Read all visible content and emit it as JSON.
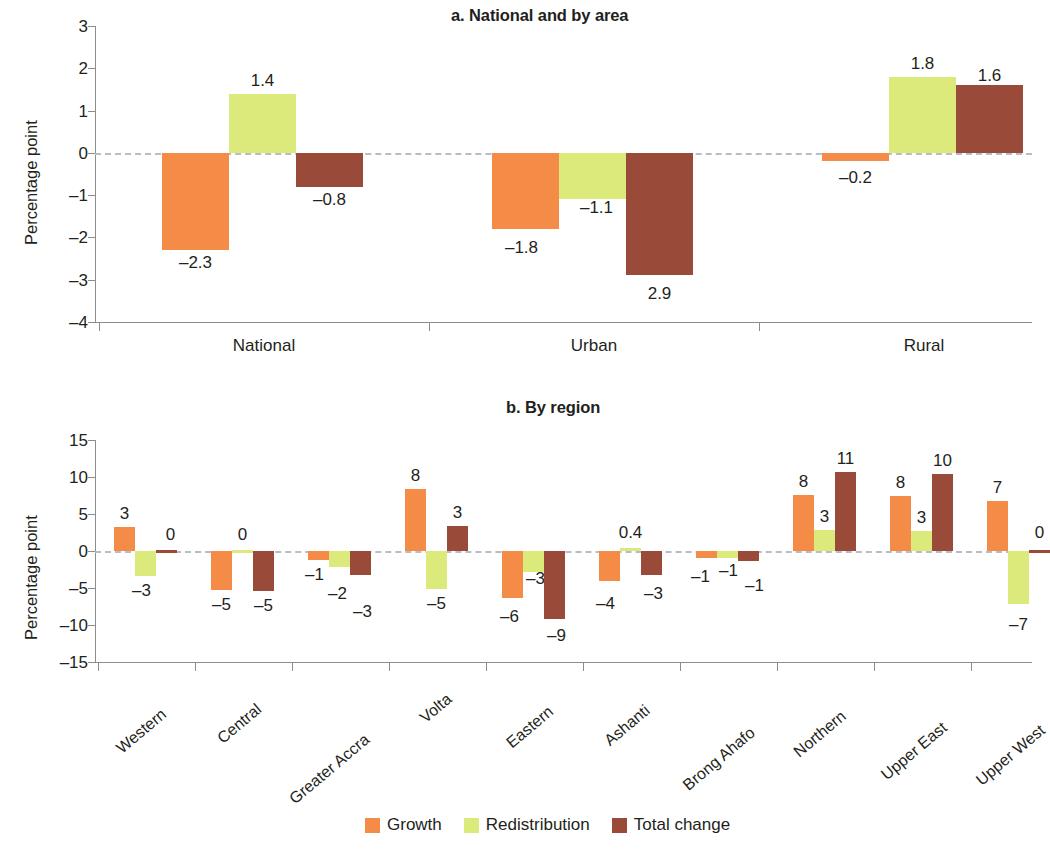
{
  "figure": {
    "legend": {
      "items": [
        {
          "label": "Growth",
          "color": "#F48B47"
        },
        {
          "label": "Redistribution",
          "color": "#DCEA7C"
        },
        {
          "label": "Total change",
          "color": "#9A4A38"
        }
      ]
    }
  },
  "chart_data": [
    {
      "type": "bar",
      "title": "a. National and by area",
      "xlabel": "",
      "ylabel": "Percentage point",
      "categories": [
        "National",
        "Urban",
        "Rural"
      ],
      "yticks": [
        3,
        2,
        1,
        0,
        -1,
        -2,
        -3,
        -4
      ],
      "ytick_labels": [
        "3",
        "2",
        "1",
        "0",
        "-1",
        "-2",
        "-3",
        "-4"
      ],
      "ylim": [
        -4,
        3
      ],
      "grid": false,
      "legend_position": "bottom",
      "series": [
        {
          "name": "Growth",
          "color": "#F48B47",
          "values": [
            -2.3,
            -1.8,
            -0.2
          ],
          "labels": [
            "-2.3",
            "-1.8",
            "-0.2"
          ]
        },
        {
          "name": "Redistribution",
          "color": "#DCEA7C",
          "values": [
            1.4,
            -1.1,
            1.8
          ],
          "labels": [
            "1.4",
            "-1.1",
            "1.8"
          ]
        },
        {
          "name": "Total change",
          "color": "#9A4A38",
          "values": [
            -0.8,
            -2.9,
            1.6
          ],
          "labels": [
            "-0.8",
            "2.9",
            "1.6"
          ]
        }
      ]
    },
    {
      "type": "bar",
      "title": "b. By region",
      "xlabel": "",
      "ylabel": "Percentage point",
      "categories": [
        "Western",
        "Central",
        "Greater Accra",
        "Volta",
        "Eastern",
        "Ashanti",
        "Brong Ahafo",
        "Northern",
        "Upper East",
        "Upper West"
      ],
      "yticks": [
        15,
        10,
        5,
        0,
        -5,
        -10,
        -15
      ],
      "ytick_labels": [
        "15",
        "10",
        "5",
        "0",
        "-5",
        "-10",
        "-15"
      ],
      "ylim": [
        -15,
        15
      ],
      "grid": false,
      "legend_position": "bottom",
      "series": [
        {
          "name": "Growth",
          "color": "#F48B47",
          "values": [
            3.3,
            -5.3,
            -1.2,
            8.4,
            -6.4,
            -4.1,
            -1.0,
            7.6,
            7.5,
            6.8
          ],
          "labels": [
            "3",
            "-5",
            "-1",
            "8",
            "-6",
            "-4",
            "-1",
            "8",
            "8",
            "7"
          ]
        },
        {
          "name": "Redistribution",
          "color": "#DCEA7C",
          "values": [
            -3.4,
            0.2,
            -2.2,
            -5.2,
            -2.8,
            0.4,
            -1.0,
            2.8,
            2.7,
            -7.1
          ],
          "labels": [
            "-3",
            "0",
            "-2",
            "-5",
            "-3",
            "0.4",
            "-1",
            "3",
            "3",
            "-7"
          ]
        },
        {
          "name": "Total change",
          "color": "#9A4A38",
          "values": [
            0.15,
            -5.4,
            -3.3,
            3.4,
            -9.2,
            -3.2,
            -1.3,
            10.7,
            10.4,
            0.15
          ],
          "labels": [
            "0",
            "-5",
            "-3",
            "3",
            "-9",
            "-3",
            "-1",
            "11",
            "10",
            "0"
          ]
        }
      ]
    }
  ]
}
